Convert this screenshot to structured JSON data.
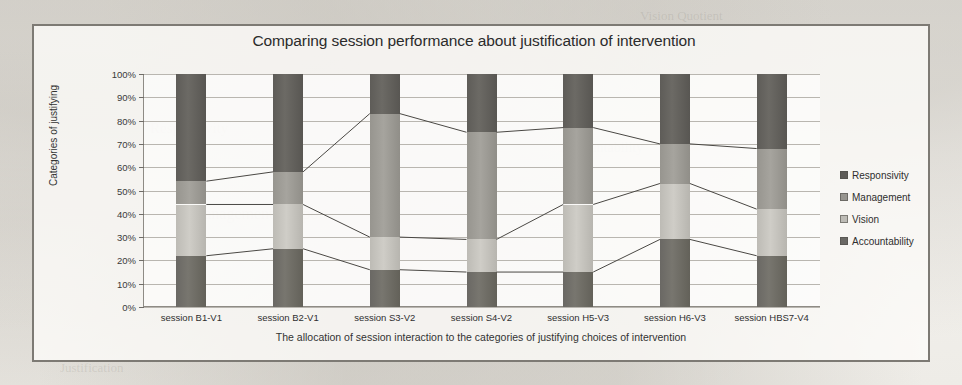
{
  "chart_data": {
    "type": "bar",
    "stacked": true,
    "orientation": "vertical",
    "title": "Comparing session performance about justification of intervention",
    "xlabel": "The allocation of session interaction to the categories of justifying choices of  intervention",
    "ylabel": "Categories of justifying",
    "ylim": [
      0,
      100
    ],
    "ytick_labels": [
      "100%",
      "90%",
      "80%",
      "70%",
      "60%",
      "50%",
      "40%",
      "30%",
      "20%",
      "10%",
      "0%"
    ],
    "ytick_values": [
      100,
      90,
      80,
      70,
      60,
      50,
      40,
      30,
      20,
      10,
      0
    ],
    "grid": true,
    "legend_position": "right",
    "categories": [
      "session B1-V1",
      "session B2-V1",
      "session S3-V2",
      "session S4-V2",
      "session H5-V3",
      "session H6-V3",
      "session HBS7-V4"
    ],
    "series": [
      {
        "name": "Responsivity",
        "color": "#5e5c58",
        "values": [
          46,
          42,
          17,
          25,
          23,
          30,
          32
        ]
      },
      {
        "name": "Management",
        "color": "#97958f",
        "values": [
          10,
          14,
          53,
          46,
          33,
          17,
          26
        ]
      },
      {
        "name": "Vision",
        "color": "#bdbbb5",
        "values": [
          22,
          19,
          14,
          14,
          29,
          24,
          20
        ]
      },
      {
        "name": "Accountability",
        "color": "#6a6864",
        "values": [
          22,
          25,
          16,
          15,
          15,
          29,
          22
        ]
      }
    ],
    "cumulative_boundaries": {
      "note": "top of each stack segment, bottom-to-top: Accountability, Vision, Management, Responsivity",
      "accountability_top": [
        22,
        25,
        16,
        15,
        15,
        29,
        22
      ],
      "vision_top": [
        44,
        44,
        30,
        29,
        44,
        53,
        42
      ],
      "management_top": [
        54,
        58,
        83,
        75,
        77,
        70,
        68
      ],
      "responsivity_top": [
        100,
        100,
        100,
        100,
        100,
        100,
        100
      ]
    }
  },
  "legend": {
    "items": [
      {
        "label": "Responsivity",
        "swatch": "#5e5c58"
      },
      {
        "label": "Management",
        "swatch": "#97958f"
      },
      {
        "label": "Vision",
        "swatch": "#bdbbb5"
      },
      {
        "label": "Accountability",
        "swatch": "#6a6864"
      }
    ]
  },
  "bleed_text": {
    "a": "Vision Quotient",
    "b": "Responsivity",
    "c": "Management Support",
    "d": "Accountability",
    "e": "Justification"
  }
}
